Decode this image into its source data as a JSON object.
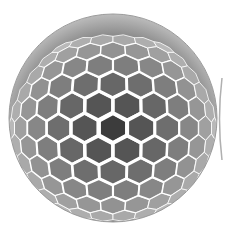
{
  "image": {
    "subject": "hexagonal-cell-sphere",
    "palette": {
      "background": "#ffffff",
      "cell_dark": "#4a4a4a",
      "cell_mid": "#6e6e6e",
      "cell_light": "#a8a8a8",
      "cell_pale": "#d8d8d8",
      "rim": "#ffffff"
    },
    "sphere": {
      "cx": 113,
      "cy": 120,
      "r": 104
    }
  }
}
